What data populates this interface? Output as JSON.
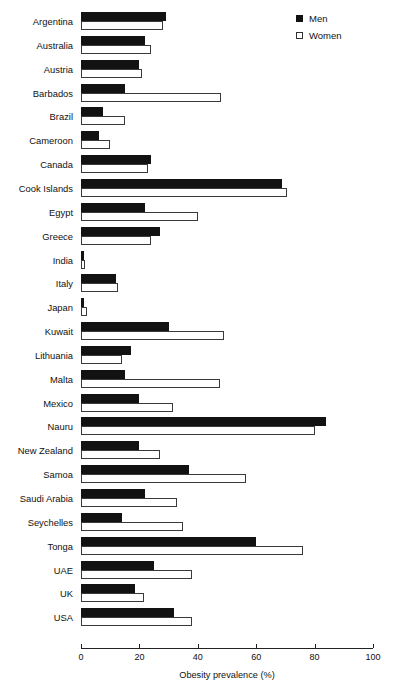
{
  "chart_data": {
    "type": "bar",
    "orientation": "horizontal",
    "title": "",
    "xlabel": "Obesity prevalence (%)",
    "ylabel": "",
    "xlim": [
      0,
      100
    ],
    "xticks": [
      0,
      20,
      40,
      60,
      80,
      100
    ],
    "grid": false,
    "legend_position": "top-right",
    "categories": [
      "Argentina",
      "Australia",
      "Austria",
      "Barbados",
      "Brazil",
      "Cameroon",
      "Canada",
      "Cook Islands",
      "Egypt",
      "Greece",
      "India",
      "Italy",
      "Japan",
      "Kuwait",
      "Lithuania",
      "Malta",
      "Mexico",
      "Nauru",
      "New Zealand",
      "Samoa",
      "Saudi Arabia",
      "Seychelles",
      "Tonga",
      "UAE",
      "UK",
      "USA"
    ],
    "series": [
      {
        "name": "Men",
        "color": "#121212",
        "fill": "solid",
        "values": [
          29,
          22,
          20,
          15,
          7.5,
          6,
          24,
          69,
          22,
          27,
          1,
          12,
          1,
          30,
          17,
          15,
          20,
          84,
          20,
          37,
          22,
          14,
          60,
          25,
          18.5,
          32
        ]
      },
      {
        "name": "Women",
        "color": "#ffffff",
        "fill": "open",
        "values": [
          28,
          24,
          21,
          48,
          15,
          10,
          23,
          70.5,
          40,
          24,
          1.2,
          12.5,
          2,
          49,
          14,
          47.5,
          31.5,
          80,
          27,
          56.5,
          33,
          35,
          76,
          38,
          21.5,
          38
        ]
      }
    ]
  },
  "legend": {
    "items": [
      {
        "label": "Men",
        "swatch": "filled-square"
      },
      {
        "label": "Women",
        "swatch": "open-square"
      }
    ]
  },
  "axis": {
    "x_label": "Obesity prevalence (%)",
    "x_tick_labels": [
      "0",
      "20",
      "40",
      "60",
      "80",
      "100"
    ]
  }
}
